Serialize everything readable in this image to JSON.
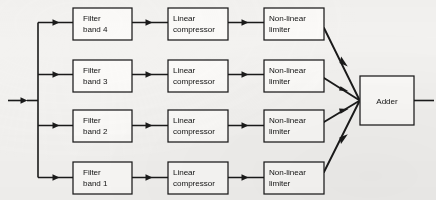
{
  "diagram": {
    "type": "block-diagram",
    "background_color": "#f3f2f0",
    "line_color": "#1a1a1a",
    "box_fill_color": "#fbfaf8",
    "input": {
      "label": "",
      "arrow_direction": "right"
    },
    "output": {
      "label": "",
      "arrow_direction": "right"
    },
    "rows": [
      {
        "id": "row-4",
        "stages": [
          {
            "id": "filter-band-4",
            "line1": "Filter",
            "line2": "band 4"
          },
          {
            "id": "linear-compressor-4",
            "line1": "Linear",
            "line2": "compressor"
          },
          {
            "id": "non-linear-limiter-4",
            "line1": "Non-linear",
            "line2": "limiter"
          }
        ]
      },
      {
        "id": "row-3",
        "stages": [
          {
            "id": "filter-band-3",
            "line1": "Filter",
            "line2": "band 3"
          },
          {
            "id": "linear-compressor-3",
            "line1": "Linear",
            "line2": "compressor"
          },
          {
            "id": "non-linear-limiter-3",
            "line1": "Non-linear",
            "line2": "limiter"
          }
        ]
      },
      {
        "id": "row-2",
        "stages": [
          {
            "id": "filter-band-2",
            "line1": "Filter",
            "line2": "band 2"
          },
          {
            "id": "linear-compressor-2",
            "line1": "Linear",
            "line2": "compressor"
          },
          {
            "id": "non-linear-limiter-2",
            "line1": "Non-linear",
            "line2": "limiter"
          }
        ]
      },
      {
        "id": "row-1",
        "stages": [
          {
            "id": "filter-band-1",
            "line1": "Filter",
            "line2": "band 1"
          },
          {
            "id": "linear-compressor-1",
            "line1": "Linear",
            "line2": "compressor"
          },
          {
            "id": "non-linear-limiter-1",
            "line1": "Non-linear",
            "line2": "limiter"
          }
        ]
      }
    ],
    "summing": {
      "id": "adder",
      "label": "Adder"
    }
  }
}
